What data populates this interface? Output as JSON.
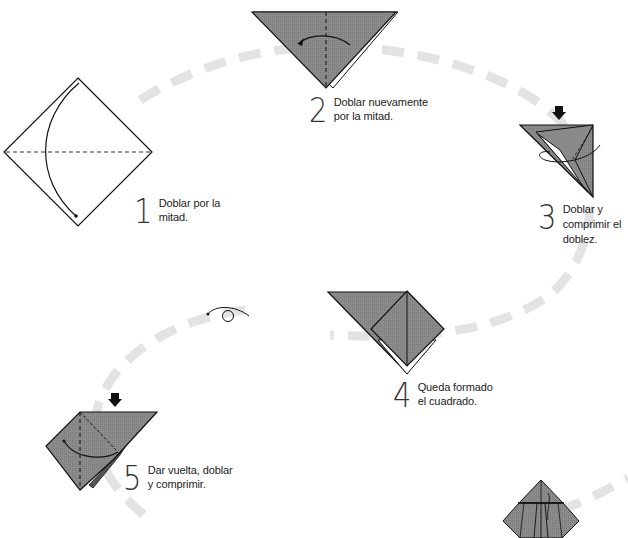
{
  "colors": {
    "paper_fill": "#8a8a8a",
    "outline": "#111111",
    "path_dash": "#e4e4e4",
    "background": "#ffffff"
  },
  "steps": [
    {
      "number": "1",
      "lines": [
        "Doblar por la",
        "mitad."
      ]
    },
    {
      "number": "2",
      "lines": [
        "Doblar nuevamente",
        "por la mitad."
      ]
    },
    {
      "number": "3",
      "lines": [
        "Doblar y",
        "comprimir el",
        "doblez."
      ]
    },
    {
      "number": "4",
      "lines": [
        "Queda formado",
        "el cuadrado."
      ]
    },
    {
      "number": "5",
      "lines": [
        "Dar vuelta, doblar",
        "y comprimir."
      ]
    }
  ],
  "symbols": {
    "turn_over": "turn-over-symbol",
    "push_arrow": "push-down-arrow",
    "fold_arrow": "fold-arrow"
  }
}
